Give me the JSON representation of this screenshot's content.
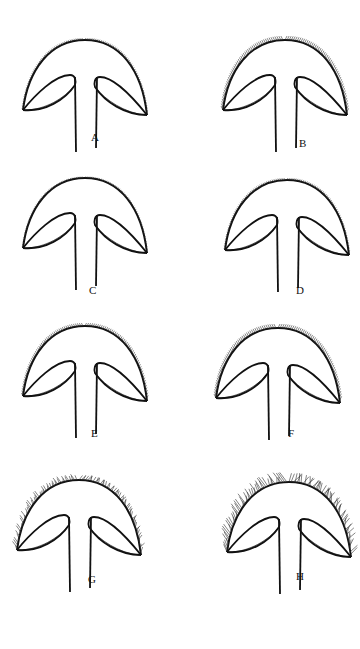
{
  "figure": {
    "type": "botanical line drawing",
    "panels": [
      {
        "label": "A",
        "hair": "fine short",
        "x": 20,
        "y": 30
      },
      {
        "label": "B",
        "hair": "sparse straight bristles",
        "x": 220,
        "y": 30
      },
      {
        "label": "C",
        "hair": "very fine",
        "x": 20,
        "y": 168
      },
      {
        "label": "D",
        "hair": "fine short",
        "x": 222,
        "y": 170
      },
      {
        "label": "E",
        "hair": "short dense",
        "x": 20,
        "y": 316
      },
      {
        "label": "F",
        "hair": "medium dense",
        "x": 213,
        "y": 318
      },
      {
        "label": "G",
        "hair": "dense woolly",
        "x": 14,
        "y": 470
      },
      {
        "label": "H",
        "hair": "long curly",
        "x": 224,
        "y": 472
      }
    ]
  }
}
